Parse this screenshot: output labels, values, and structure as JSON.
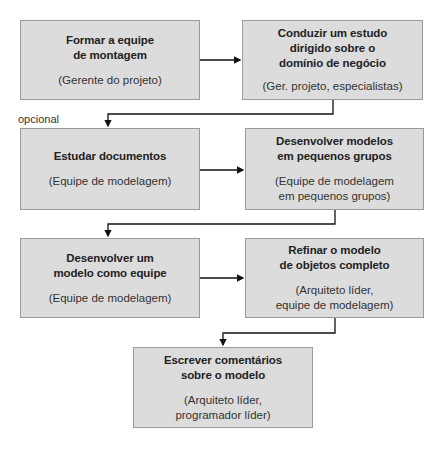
{
  "diagram": {
    "type": "flowchart",
    "optional_label": "opcional",
    "steps": [
      {
        "title": "Formar a equipe\nde montagem",
        "role": "(Gerente do projeto)"
      },
      {
        "title": "Conduzir um estudo\ndirigido sobre o\ndomínio de negócio",
        "role": "(Ger. projeto, especialistas)"
      },
      {
        "title": "Estudar documentos",
        "role": "(Equipe de modelagem)"
      },
      {
        "title": "Desenvolver modelos\nem pequenos grupos",
        "role": "(Equipe de modelagem\nem pequenos grupos)"
      },
      {
        "title": "Desenvolver um\nmodelo como equipe",
        "role": "(Equipe de modelagem)"
      },
      {
        "title": "Refinar o modelo\nde objetos completo",
        "role": "(Arquiteto líder,\nequipe de modelagem)"
      },
      {
        "title": "Escrever comentários\nsobre o modelo",
        "role": "(Arquiteto líder,\nprogramador líder)"
      }
    ],
    "colors": {
      "box_fill": "#dcdcdc",
      "box_border": "#9a9a9a",
      "connector": "#111111"
    }
  }
}
